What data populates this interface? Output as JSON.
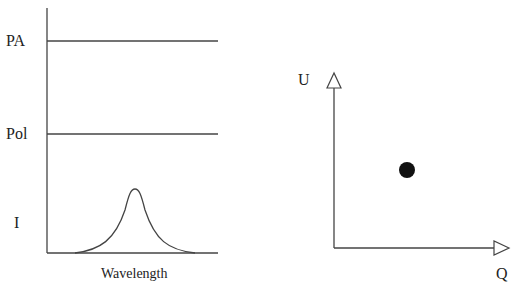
{
  "left_panel": {
    "rows": [
      {
        "label": "PA",
        "type": "flat"
      },
      {
        "label": "Pol",
        "type": "flat"
      },
      {
        "label": "I",
        "type": "emission-line-profile"
      }
    ],
    "xlabel": "Wavelength"
  },
  "right_panel": {
    "xlabel": "Q",
    "ylabel": "U",
    "point": {
      "desc": "single filled point in Q-U plane"
    }
  },
  "colors": {
    "line": "#333333",
    "point": "#111111",
    "background": "#ffffff"
  }
}
